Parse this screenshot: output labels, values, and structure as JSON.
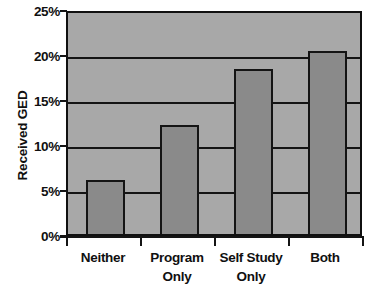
{
  "chart_data": {
    "type": "bar",
    "title": "",
    "xlabel": "",
    "ylabel": "Received GED",
    "categories": [
      "Neither",
      "Program Only",
      "Self Study Only",
      "Both"
    ],
    "category_lines": [
      [
        "Neither"
      ],
      [
        "Program",
        "Only"
      ],
      [
        "Self Study",
        "Only"
      ],
      [
        "Both"
      ]
    ],
    "values": [
      6.0,
      12.1,
      18.3,
      20.3
    ],
    "value_unit": "%",
    "ylim": [
      0,
      25
    ],
    "yticks": [
      0,
      5,
      10,
      15,
      20,
      25
    ],
    "ytick_labels": [
      "0%",
      "5%",
      "10%",
      "15%",
      "20%",
      "25%"
    ],
    "grid": true,
    "grid_axis": "y",
    "legend": false,
    "legend_position": "none",
    "colors": {
      "bar_fill": "#8a8a8a",
      "plot_background": "#a8a8a8",
      "axis_line": "#141414",
      "gridline": "#141414",
      "text": "#101010",
      "page_background": "#ffffff"
    }
  }
}
